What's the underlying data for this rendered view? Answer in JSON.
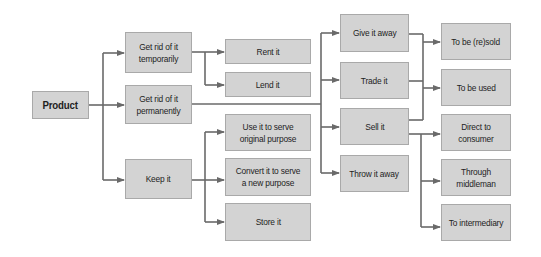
{
  "diagram": {
    "type": "flowchart",
    "colors": {
      "node_fill": "#d3d3d3",
      "node_border": "#a9a9a9",
      "edge": "#6a6a6a",
      "text": "#1e1e1e"
    },
    "nodes": {
      "product": "Product",
      "get_rid_temp": "Get rid of it temporarily",
      "get_rid_perm": "Get rid of it permanently",
      "keep": "Keep it",
      "rent": "Rent it",
      "lend": "Lend it",
      "use_orig": "Use it to serve original purpose",
      "convert": "Convert it to serve a new purpose",
      "store": "Store it",
      "give_away": "Give it away",
      "trade": "Trade it",
      "sell": "Sell it",
      "throw_away": "Throw it away",
      "resold": "To be (re)sold",
      "used": "To be used",
      "direct": "Direct to consumer",
      "middleman": "Through middleman",
      "intermediary": "To intermediary"
    },
    "edges": [
      [
        "Product",
        "Get rid of it temporarily"
      ],
      [
        "Product",
        "Get rid of it permanently"
      ],
      [
        "Product",
        "Keep it"
      ],
      [
        "Get rid of it temporarily",
        "Rent it"
      ],
      [
        "Get rid of it temporarily",
        "Lend it"
      ],
      [
        "Get rid of it permanently",
        "Give it away"
      ],
      [
        "Get rid of it permanently",
        "Trade it"
      ],
      [
        "Get rid of it permanently",
        "Sell it"
      ],
      [
        "Get rid of it permanently",
        "Throw it away"
      ],
      [
        "Keep it",
        "Use it to serve original purpose"
      ],
      [
        "Keep it",
        "Convert it to serve a new purpose"
      ],
      [
        "Keep it",
        "Store it"
      ],
      [
        "Give it away / Trade it / Sell it",
        "To be (re)sold"
      ],
      [
        "Give it away / Trade it / Sell it",
        "To be used"
      ],
      [
        "Sell it",
        "Direct to consumer"
      ],
      [
        "Sell it",
        "Through middleman"
      ],
      [
        "Sell it",
        "To intermediary"
      ]
    ]
  }
}
